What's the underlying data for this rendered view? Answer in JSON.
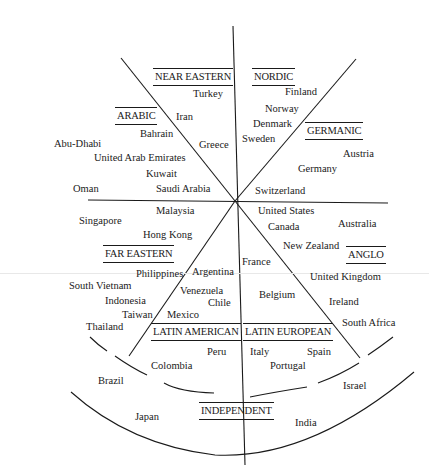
{
  "diagram": {
    "title": "",
    "clusters": [
      {
        "id": "near_eastern",
        "label": "NEAR EASTERN",
        "x": 153,
        "y": 68
      },
      {
        "id": "nordic",
        "label": "NORDIC",
        "x": 252,
        "y": 68
      },
      {
        "id": "arabic",
        "label": "ARABIC",
        "x": 115,
        "y": 107
      },
      {
        "id": "germanic",
        "label": "GERMANIC",
        "x": 305,
        "y": 122
      },
      {
        "id": "far_eastern",
        "label": "FAR EASTERN",
        "x": 103,
        "y": 245
      },
      {
        "id": "anglo",
        "label": "ANGLO",
        "x": 346,
        "y": 246
      },
      {
        "id": "latin_american",
        "label": "LATIN AMERICAN",
        "x": 151,
        "y": 323
      },
      {
        "id": "latin_european",
        "label": "LATIN EUROPEAN",
        "x": 243,
        "y": 323
      },
      {
        "id": "independent",
        "label": "INDEPENDENT",
        "x": 199,
        "y": 402
      }
    ],
    "countries": [
      {
        "cluster": "near_eastern",
        "name": "Turkey",
        "x": 193,
        "y": 88
      },
      {
        "cluster": "near_eastern",
        "name": "Iran",
        "x": 176,
        "y": 111
      },
      {
        "cluster": "near_eastern",
        "name": "Greece",
        "x": 199,
        "y": 139
      },
      {
        "cluster": "nordic",
        "name": "Finland",
        "x": 285,
        "y": 86
      },
      {
        "cluster": "nordic",
        "name": "Norway",
        "x": 265,
        "y": 103
      },
      {
        "cluster": "nordic",
        "name": "Denmark",
        "x": 253,
        "y": 118
      },
      {
        "cluster": "nordic",
        "name": "Sweden",
        "x": 242,
        "y": 133
      },
      {
        "cluster": "arabic",
        "name": "Bahrain",
        "x": 140,
        "y": 128
      },
      {
        "cluster": "arabic",
        "name": "Abu-Dhabi",
        "x": 54,
        "y": 138
      },
      {
        "cluster": "arabic",
        "name": "United Arab Emirates",
        "x": 94,
        "y": 152
      },
      {
        "cluster": "arabic",
        "name": "Kuwait",
        "x": 146,
        "y": 168
      },
      {
        "cluster": "arabic",
        "name": "Oman",
        "x": 73,
        "y": 183
      },
      {
        "cluster": "arabic",
        "name": "Saudi Arabia",
        "x": 156,
        "y": 183
      },
      {
        "cluster": "germanic",
        "name": "Austria",
        "x": 343,
        "y": 148
      },
      {
        "cluster": "germanic",
        "name": "Germany",
        "x": 298,
        "y": 163
      },
      {
        "cluster": "germanic",
        "name": "Switzerland",
        "x": 255,
        "y": 185
      },
      {
        "cluster": "far_eastern",
        "name": "Malaysia",
        "x": 156,
        "y": 205
      },
      {
        "cluster": "far_eastern",
        "name": "Singapore",
        "x": 79,
        "y": 215
      },
      {
        "cluster": "far_eastern",
        "name": "Hong Kong",
        "x": 143,
        "y": 229
      },
      {
        "cluster": "far_eastern",
        "name": "Philippines",
        "x": 136,
        "y": 268
      },
      {
        "cluster": "far_eastern",
        "name": "South Vietnam",
        "x": 69,
        "y": 280
      },
      {
        "cluster": "far_eastern",
        "name": "Indonesia",
        "x": 105,
        "y": 295
      },
      {
        "cluster": "far_eastern",
        "name": "Taiwan",
        "x": 122,
        "y": 309
      },
      {
        "cluster": "far_eastern",
        "name": "Thailand",
        "x": 86,
        "y": 321
      },
      {
        "cluster": "anglo",
        "name": "United States",
        "x": 258,
        "y": 205
      },
      {
        "cluster": "anglo",
        "name": "Canada",
        "x": 268,
        "y": 221
      },
      {
        "cluster": "anglo",
        "name": "Australia",
        "x": 338,
        "y": 218
      },
      {
        "cluster": "anglo",
        "name": "New Zealand",
        "x": 283,
        "y": 240
      },
      {
        "cluster": "anglo",
        "name": "United Kingdom",
        "x": 310,
        "y": 271
      },
      {
        "cluster": "anglo",
        "name": "Ireland",
        "x": 329,
        "y": 296
      },
      {
        "cluster": "anglo",
        "name": "South Africa",
        "x": 342,
        "y": 317
      },
      {
        "cluster": "latin_american",
        "name": "Argentina",
        "x": 192,
        "y": 266
      },
      {
        "cluster": "latin_american",
        "name": "Venezuela",
        "x": 180,
        "y": 285
      },
      {
        "cluster": "latin_american",
        "name": "Chile",
        "x": 208,
        "y": 297
      },
      {
        "cluster": "latin_american",
        "name": "Mexico",
        "x": 167,
        "y": 309
      },
      {
        "cluster": "latin_american",
        "name": "Peru",
        "x": 207,
        "y": 346
      },
      {
        "cluster": "latin_american",
        "name": "Colombia",
        "x": 151,
        "y": 360
      },
      {
        "cluster": "latin_european",
        "name": "France",
        "x": 242,
        "y": 256
      },
      {
        "cluster": "latin_european",
        "name": "Belgium",
        "x": 259,
        "y": 289
      },
      {
        "cluster": "latin_european",
        "name": "Italy",
        "x": 250,
        "y": 346
      },
      {
        "cluster": "latin_european",
        "name": "Spain",
        "x": 307,
        "y": 346
      },
      {
        "cluster": "latin_european",
        "name": "Portugal",
        "x": 270,
        "y": 360
      },
      {
        "cluster": "independent",
        "name": "Brazil",
        "x": 98,
        "y": 375
      },
      {
        "cluster": "independent",
        "name": "Israel",
        "x": 343,
        "y": 380
      },
      {
        "cluster": "independent",
        "name": "Japan",
        "x": 135,
        "y": 411
      },
      {
        "cluster": "independent",
        "name": "India",
        "x": 295,
        "y": 417
      }
    ],
    "center": {
      "x": 235,
      "y": 201
    }
  }
}
